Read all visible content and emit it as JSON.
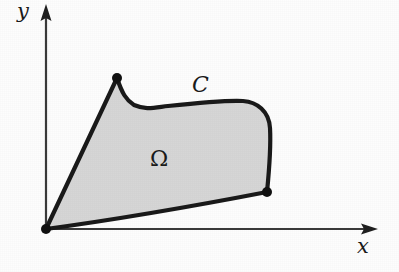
{
  "figure": {
    "kind": "math-region-diagram",
    "background_color": "#fdfdfd",
    "labels": {
      "y_axis": "y",
      "x_axis": "x",
      "curve": "C",
      "region": "Ω"
    },
    "colors": {
      "region_fill": "#d6d6d6",
      "boundary_stroke": "#1a1a1a",
      "axis_stroke": "#3a3a3a",
      "vertex_dot": "#111111",
      "label_text": "#1a1a1a"
    },
    "axes": {
      "origin": [
        46,
        229
      ],
      "y_axis": {
        "from": [
          46,
          229
        ],
        "to": [
          46,
          8
        ],
        "arrow": "up",
        "tip": [
          46,
          4
        ]
      },
      "x_axis": {
        "from": [
          46,
          229
        ],
        "to": [
          372,
          229
        ],
        "arrow": "right",
        "tip": [
          378,
          229
        ]
      },
      "stroke_width": 2.2,
      "arrow_head_width": 11,
      "arrow_head_length": 17
    },
    "region": {
      "name": "Ω",
      "label_position": [
        161,
        161
      ],
      "fill": "#d6d6d6",
      "boundary_name": "C",
      "boundary_label_position": [
        201,
        86
      ],
      "boundary_stroke_width": 4.2,
      "vertices": [
        {
          "id": "origin-vertex",
          "point": [
            46,
            229
          ],
          "dot_radius": 5.0
        },
        {
          "id": "cusp-vertex",
          "point": [
            117,
            78
          ],
          "dot_radius": 5.0
        },
        {
          "id": "right-vertex",
          "point": [
            267,
            192
          ],
          "dot_radius": 5.0
        }
      ],
      "boundary_path": "M 46 229 L 117 78 C 122 93 126 100 134 105 C 146 110 152 108 168 106 C 196 103 224 100 243 101 C 257 102 269 111 270 128 C 271 146 269 172 267 192 C 210 203 120 219 46 229 Z"
    }
  }
}
